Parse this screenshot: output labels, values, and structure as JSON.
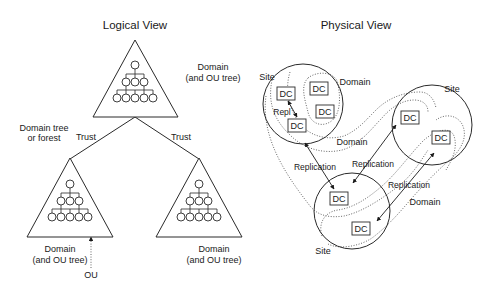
{
  "logical_view": {
    "title": "Logical View",
    "top_domain": {
      "label_line1": "Domain",
      "label_line2": "(and OU tree)"
    },
    "forest_label": {
      "line1": "Domain tree",
      "line2": "or forest"
    },
    "trust_left": "Trust",
    "trust_right": "Trust",
    "bottom_left_domain": {
      "label_line1": "Domain",
      "label_line2": "(and OU tree)"
    },
    "bottom_right_domain": {
      "label_line1": "Domain",
      "label_line2": "(and OU tree)"
    },
    "ou_label": "OU"
  },
  "physical_view": {
    "title": "Physical View",
    "site_labels": [
      "Site",
      "Site",
      "Site"
    ],
    "domain_labels": [
      "Domain",
      "Domain",
      "Domain"
    ],
    "replication_labels": [
      "Repl",
      "Replication",
      "Replication",
      "Replication"
    ],
    "dc_label": "DC",
    "dc_count": 7
  },
  "colors": {
    "stroke": "#2a2a2a",
    "text": "#1a1a1a",
    "background": "#ffffff"
  }
}
